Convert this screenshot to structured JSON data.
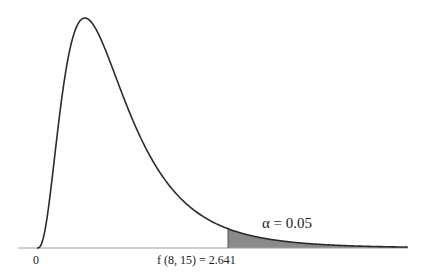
{
  "chart_data": {
    "type": "area",
    "title": "",
    "distribution": "F",
    "df1": 8,
    "df2": 15,
    "xlabel": "",
    "ylabel": "",
    "xlim": [
      0,
      5.13
    ],
    "grid": false,
    "legend": "none",
    "critical_value": 2.641,
    "alpha": 0.05,
    "shaded_region": "right tail, x >= 2.641",
    "tick_labels": [
      "0",
      "f (8, 15) = 2.641"
    ],
    "annotations": [
      "α = 0.05"
    ],
    "x": [
      0.0,
      0.1,
      0.2,
      0.3,
      0.4,
      0.5,
      0.66,
      0.8,
      1.0,
      1.25,
      1.5,
      1.75,
      2.0,
      2.25,
      2.641,
      3.0,
      3.5,
      4.0,
      4.5,
      5.13
    ],
    "y": [
      0.0,
      0.0118,
      0.1206,
      0.3219,
      0.5181,
      0.6594,
      0.7444,
      0.7188,
      0.6089,
      0.4469,
      0.3027,
      0.1956,
      0.1228,
      0.076,
      0.0387,
      0.0216,
      0.01,
      0.0048,
      0.0024,
      0.0011
    ],
    "colors": {
      "curve": "#2b2b2b",
      "shade": "#8a8a8a",
      "axis": "#9a9a9a"
    }
  },
  "labels": {
    "zero": "0",
    "critical": "f (8, 15) = 2.641",
    "alpha": "α = 0.05"
  }
}
